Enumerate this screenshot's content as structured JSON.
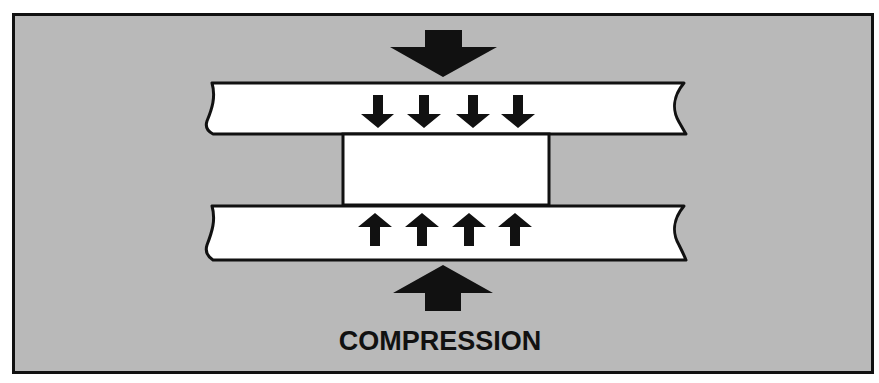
{
  "diagram": {
    "title": "COMPRESSION",
    "colors": {
      "background": "#b9b9b9",
      "frame": "#111111",
      "plate_fill": "#ffffff",
      "arrow": "#111111",
      "page": "#ffffff"
    },
    "elements": {
      "top_force_arrow": {
        "direction": "down",
        "icon": "large-down-arrow"
      },
      "top_plate": {
        "icon": "broken-plate"
      },
      "top_small_arrows": {
        "count": 4,
        "direction": "down"
      },
      "specimen_block": {
        "icon": "rectangle-block"
      },
      "bottom_plate": {
        "icon": "broken-plate"
      },
      "bottom_small_arrows": {
        "count": 4,
        "direction": "up"
      },
      "bottom_force_arrow": {
        "direction": "up",
        "icon": "large-up-arrow"
      }
    }
  }
}
